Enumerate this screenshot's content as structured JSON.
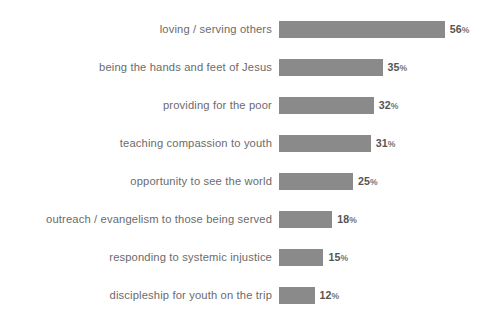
{
  "chart_data": {
    "type": "bar",
    "orientation": "horizontal",
    "title": "",
    "subtitle": "",
    "xlabel": "",
    "ylabel": "",
    "grid": false,
    "legend": false,
    "legend_position": "none",
    "axis_visible": false,
    "xlim": [
      0,
      56
    ],
    "value_suffix": "%",
    "bar_color": "#8a8a8a",
    "label_color": "#6b6b6b",
    "value_color": "#555555",
    "background_color": "#ffffff",
    "categories": [
      "loving / serving others",
      "being the hands and feet of Jesus",
      "providing for the poor",
      "teaching compassion to youth",
      "opportunity to see the world",
      "outreach / evangelism to those being served",
      "responding to systemic injustice",
      "discipleship for youth on the trip"
    ],
    "values": [
      56,
      35,
      32,
      31,
      25,
      18,
      15,
      12
    ],
    "value_labels": [
      "56%",
      "35%",
      "32%",
      "31%",
      "25%",
      "18%",
      "15%",
      "12%"
    ],
    "bars": [
      {
        "label": "loving / serving others",
        "value": 56,
        "value_text": "56",
        "suffix": "%"
      },
      {
        "label": "being the hands and feet of Jesus",
        "value": 35,
        "value_text": "35",
        "suffix": "%"
      },
      {
        "label": "providing for the poor",
        "value": 32,
        "value_text": "32",
        "suffix": "%"
      },
      {
        "label": "teaching compassion to youth",
        "value": 31,
        "value_text": "31",
        "suffix": "%"
      },
      {
        "label": "opportunity to see the world",
        "value": 25,
        "value_text": "25",
        "suffix": "%"
      },
      {
        "label": "outreach / evangelism to those being served",
        "value": 18,
        "value_text": "18",
        "suffix": "%"
      },
      {
        "label": "responding to systemic injustice",
        "value": 15,
        "value_text": "15",
        "suffix": "%"
      },
      {
        "label": "discipleship for youth on the trip",
        "value": 12,
        "value_text": "12",
        "suffix": "%"
      }
    ]
  }
}
